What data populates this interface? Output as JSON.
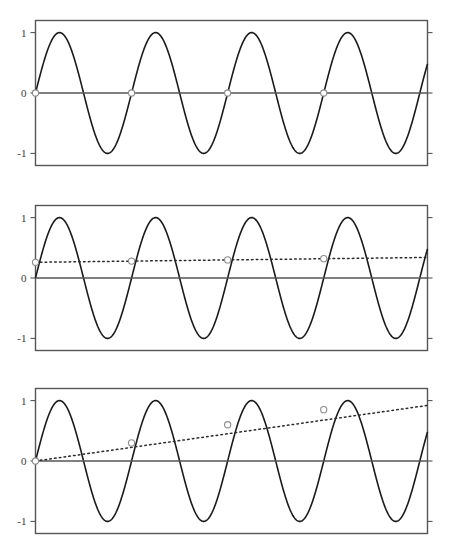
{
  "figure": {
    "title_fragment": "",
    "background_color": "#ffffff",
    "width": 454,
    "height": 558,
    "panel_count": 3
  },
  "style": {
    "axis_color": "#555555",
    "curve_color": "#1a1a1a",
    "trend_color": "#2b2b2b",
    "marker_fill": "#ffffff",
    "marker_stroke": "#8c8c8c",
    "tick_label_color": "#3a3a3a"
  },
  "chart_data": [
    {
      "type": "line",
      "title": "",
      "panel_index": 1,
      "xlabel": "",
      "ylabel": "",
      "xlim": [
        0,
        4.08
      ],
      "ylim": [
        -1.2,
        1.2
      ],
      "grid": false,
      "legend": "none",
      "ytick_labels": [
        "1",
        "0",
        "-1"
      ],
      "ytick_values": [
        1,
        0,
        -1
      ],
      "xtick_labels": [],
      "series": [
        {
          "name": "sine",
          "style": "solid",
          "amplitude": 1,
          "periods": 4.08,
          "phase": 0,
          "samples": 2
        },
        {
          "name": "zero-line",
          "style": "solid",
          "values": [
            0,
            0
          ]
        }
      ],
      "markers": {
        "name": "zero-crossing-markers",
        "shape": "open-circle",
        "x": [
          0,
          1,
          2,
          3
        ],
        "y": [
          0,
          0,
          0,
          0
        ]
      }
    },
    {
      "type": "line",
      "title": "",
      "panel_index": 2,
      "xlabel": "",
      "ylabel": "",
      "xlim": [
        0,
        4.08
      ],
      "ylim": [
        -1.2,
        1.2
      ],
      "grid": false,
      "legend": "none",
      "ytick_labels": [
        "1",
        "0",
        "-1"
      ],
      "ytick_values": [
        1,
        0,
        -1
      ],
      "xtick_labels": [],
      "series": [
        {
          "name": "sine",
          "style": "solid",
          "amplitude": 1,
          "periods": 4.08,
          "phase": 0
        },
        {
          "name": "zero-line",
          "style": "solid",
          "values": [
            0,
            0
          ]
        },
        {
          "name": "slow-trend",
          "style": "dotted",
          "x": [
            0,
            4.08
          ],
          "values": [
            0.26,
            0.34
          ]
        }
      ],
      "markers": {
        "name": "trend-markers",
        "shape": "open-circle",
        "x": [
          0,
          1,
          2,
          3
        ],
        "y": [
          0.26,
          0.28,
          0.3,
          0.32
        ]
      }
    },
    {
      "type": "line",
      "title": "",
      "panel_index": 3,
      "xlabel": "",
      "ylabel": "",
      "xlim": [
        0,
        4.08
      ],
      "ylim": [
        -1.2,
        1.2
      ],
      "grid": false,
      "legend": "none",
      "ytick_labels": [
        "1",
        "0",
        "-1"
      ],
      "ytick_values": [
        1,
        0,
        -1
      ],
      "xtick_labels": [],
      "series": [
        {
          "name": "sine",
          "style": "solid",
          "amplitude": 1,
          "periods": 4.08,
          "phase": 0
        },
        {
          "name": "zero-line",
          "style": "solid",
          "values": [
            0,
            0
          ]
        },
        {
          "name": "fast-trend",
          "style": "dotted",
          "x": [
            0,
            4.08
          ],
          "values": [
            0.0,
            0.92
          ]
        }
      ],
      "markers": {
        "name": "trend-markers",
        "shape": "open-circle",
        "x": [
          0,
          1,
          2,
          3
        ],
        "y": [
          0.0,
          0.3,
          0.6,
          0.85
        ]
      }
    }
  ]
}
